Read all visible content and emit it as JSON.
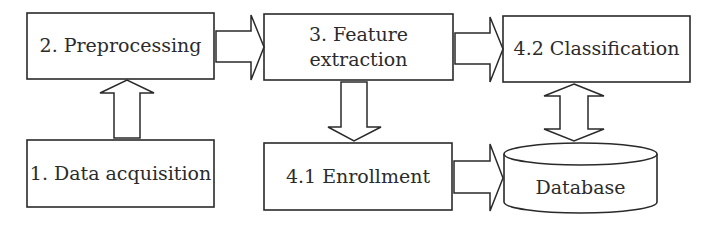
{
  "diagram": {
    "type": "flowchart",
    "nodes": {
      "preprocessing": {
        "label": "2. Preprocessing"
      },
      "feature_extraction": {
        "line1": "3. Feature",
        "line2": "extraction"
      },
      "classification": {
        "label": "4.2 Classification"
      },
      "data_acquisition": {
        "label": "1. Data acquisition"
      },
      "enrollment": {
        "label": "4.1 Enrollment"
      },
      "database": {
        "label": "Database",
        "shape": "cylinder"
      }
    },
    "edges": [
      {
        "from": "1. Data acquisition",
        "to": "2. Preprocessing",
        "direction": "up"
      },
      {
        "from": "2. Preprocessing",
        "to": "3. Feature extraction",
        "direction": "right"
      },
      {
        "from": "3. Feature extraction",
        "to": "4.2 Classification",
        "direction": "right"
      },
      {
        "from": "3. Feature extraction",
        "to": "4.1 Enrollment",
        "direction": "down"
      },
      {
        "from": "4.1 Enrollment",
        "to": "Database",
        "direction": "right"
      },
      {
        "from": "4.2 Classification",
        "to": "Database",
        "direction": "bidirectional"
      }
    ],
    "colors": {
      "stroke": "#2a2a2a",
      "fill": "#ffffff",
      "text": "#2b2b2b"
    }
  }
}
